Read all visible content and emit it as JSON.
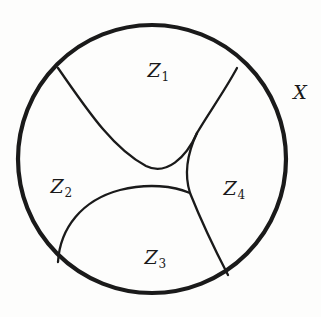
{
  "figure": {
    "background_color": "#fdfdfc",
    "ink_color": "#1a1a1a",
    "outer_boundary": {
      "name": "X",
      "shape": "circle",
      "center_x": 152,
      "center_y": 159,
      "radius": 134,
      "stroke_width": 4.2
    },
    "space_label": {
      "text": "X",
      "x": 300,
      "y": 92
    },
    "regions": [
      {
        "id": "Z1",
        "base": "Z",
        "index": "1",
        "text": "Z",
        "sub": "1",
        "x": 158,
        "y": 70
      },
      {
        "id": "Z2",
        "base": "Z",
        "index": "2",
        "text": "Z",
        "sub": "2",
        "x": 61,
        "y": 186
      },
      {
        "id": "Z3",
        "base": "Z",
        "index": "3",
        "text": "Z",
        "sub": "3",
        "x": 155,
        "y": 257
      },
      {
        "id": "Z4",
        "base": "Z",
        "index": "4",
        "text": "Z",
        "sub": "4",
        "x": 234,
        "y": 188
      }
    ],
    "internal_curves": [
      {
        "name": "boundary-z1-z2",
        "separates": "Z1 | Z2",
        "stroke_width": 2.3,
        "path": "M 58 68 C 86 108 112 148 146 166 C 166 176 186 158 197 133"
      },
      {
        "name": "boundary-z1-z4",
        "separates": "Z1 | Z4",
        "stroke_width": 2.3,
        "path": "M 237 68 C 224 92 208 114 197 133"
      },
      {
        "name": "boundary-z4-neck",
        "separates": "Z4 | neck",
        "stroke_width": 2.3,
        "path": "M 197 133 C 188 152 184 174 190 193"
      },
      {
        "name": "boundary-z2-z3",
        "separates": "Z2 | Z3",
        "stroke_width": 2.3,
        "path": "M 58 262 C 60 228 82 200 120 190 C 148 183 174 186 190 193"
      },
      {
        "name": "boundary-z3-z4",
        "separates": "Z3 | Z4",
        "stroke_width": 2.3,
        "path": "M 190 193 C 200 218 214 248 228 275"
      }
    ],
    "junctions": [
      {
        "name": "cusp-upper",
        "x": 197,
        "y": 133
      },
      {
        "name": "trivalent-lower",
        "x": 190,
        "y": 193
      }
    ]
  }
}
